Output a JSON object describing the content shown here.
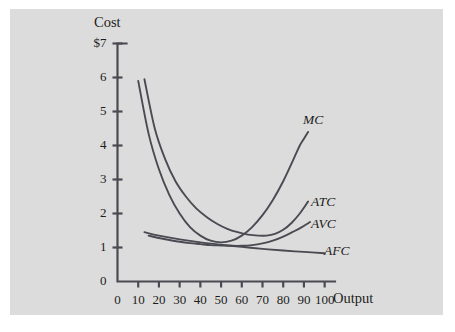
{
  "figure": {
    "background_color": "#ffffff",
    "panel_color": "#dcdcdc",
    "line_color": "#4a4a52",
    "text_color": "#1c1c20"
  },
  "chart_data": {
    "type": "line",
    "title": "",
    "xlabel": "Output",
    "ylabel": "Cost",
    "xlim": [
      0,
      105
    ],
    "ylim": [
      0,
      7
    ],
    "grid": false,
    "legend": "inline-curve-labels",
    "x_ticks": [
      "0",
      "10",
      "20",
      "30",
      "40",
      "50",
      "60",
      "70",
      "80",
      "90",
      "100"
    ],
    "x_tick_values": [
      0,
      10,
      20,
      30,
      40,
      50,
      60,
      70,
      80,
      90,
      100
    ],
    "y_ticks": [
      "0",
      "1",
      "2",
      "3",
      "4",
      "5",
      "6",
      "$7"
    ],
    "y_tick_values": [
      0,
      1,
      2,
      3,
      4,
      5,
      6,
      7
    ],
    "series": [
      {
        "name": "MC",
        "label": "MC",
        "description": "Marginal cost: falls steeply from 5.9 at output 10, reaches minimum near output 45, then rises sharply to 4.4 at output 92",
        "x": [
          10,
          15,
          20,
          25,
          30,
          35,
          40,
          45,
          50,
          55,
          60,
          65,
          70,
          75,
          80,
          85,
          88,
          90,
          92
        ],
        "y": [
          5.9,
          4.35,
          3.3,
          2.55,
          2.0,
          1.6,
          1.35,
          1.2,
          1.15,
          1.2,
          1.35,
          1.6,
          1.95,
          2.4,
          2.95,
          3.6,
          4.0,
          4.2,
          4.4
        ]
      },
      {
        "name": "ATC",
        "label": "ATC",
        "description": "Average total cost: declines from 5.95 at output 13 to minimum about 1.35 near output 72, then rises to 2.35 at output 92",
        "x": [
          13,
          18,
          23,
          28,
          33,
          38,
          43,
          48,
          53,
          58,
          63,
          68,
          72,
          76,
          80,
          84,
          88,
          92
        ],
        "y": [
          5.95,
          4.5,
          3.6,
          2.95,
          2.5,
          2.15,
          1.9,
          1.7,
          1.55,
          1.45,
          1.38,
          1.35,
          1.35,
          1.4,
          1.52,
          1.72,
          2.0,
          2.35
        ]
      },
      {
        "name": "AVC",
        "label": "AVC",
        "description": "Average variable cost: declines from 1.35 at output 15 to minimum about 1.05 near output 60, then rises to 1.75 at output 93",
        "x": [
          15,
          20,
          25,
          30,
          35,
          40,
          45,
          50,
          55,
          60,
          65,
          70,
          75,
          80,
          85,
          89,
          93
        ],
        "y": [
          1.35,
          1.28,
          1.22,
          1.17,
          1.13,
          1.1,
          1.07,
          1.06,
          1.05,
          1.05,
          1.07,
          1.12,
          1.2,
          1.32,
          1.47,
          1.6,
          1.75
        ]
      },
      {
        "name": "AFC",
        "label": "AFC",
        "description": "Average fixed cost: declines steadily from 1.45 at output 13 toward 0.8 at output 100",
        "x": [
          13,
          20,
          30,
          40,
          50,
          60,
          70,
          80,
          90,
          100
        ],
        "y": [
          1.45,
          1.35,
          1.24,
          1.15,
          1.08,
          1.02,
          0.96,
          0.91,
          0.87,
          0.83
        ]
      }
    ]
  },
  "curve_labels": {
    "mc": "MC",
    "atc": "ATC",
    "avc": "AVC",
    "afc": "AFC"
  },
  "axis_titles": {
    "cost": "Cost",
    "output": "Output"
  }
}
